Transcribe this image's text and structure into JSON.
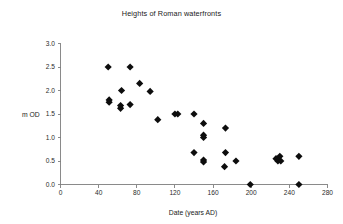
{
  "chart_data": {
    "type": "scatter",
    "title": "Heights of Roman waterfronts",
    "xlabel": "Date (years AD)",
    "ylabel": "m OD",
    "xlim": [
      0,
      280
    ],
    "ylim": [
      0,
      3.0
    ],
    "xticks": [
      0,
      40,
      80,
      120,
      160,
      200,
      240,
      280
    ],
    "xtick_labels": [
      "0",
      "40",
      "80",
      "120",
      "160",
      "200",
      "240",
      "280"
    ],
    "yticks": [
      0.0,
      0.5,
      1.0,
      1.5,
      2.0,
      2.5,
      3.0
    ],
    "ytick_labels": [
      "0.0",
      "0.5",
      "1.0",
      "1.5",
      "2.0",
      "2.5",
      "3.0"
    ],
    "grid": false,
    "legend": false,
    "marker": "diamond",
    "marker_color": "#0d0d0d",
    "points": [
      {
        "x": 50,
        "y": 2.5
      },
      {
        "x": 73,
        "y": 2.5
      },
      {
        "x": 83,
        "y": 2.15
      },
      {
        "x": 64,
        "y": 2.0
      },
      {
        "x": 94,
        "y": 1.98
      },
      {
        "x": 51,
        "y": 1.8
      },
      {
        "x": 51,
        "y": 1.75
      },
      {
        "x": 73,
        "y": 1.7
      },
      {
        "x": 63,
        "y": 1.68
      },
      {
        "x": 63,
        "y": 1.62
      },
      {
        "x": 120,
        "y": 1.5
      },
      {
        "x": 123,
        "y": 1.5
      },
      {
        "x": 140,
        "y": 1.5
      },
      {
        "x": 102,
        "y": 1.38
      },
      {
        "x": 150,
        "y": 1.3
      },
      {
        "x": 173,
        "y": 1.2
      },
      {
        "x": 150,
        "y": 1.05
      },
      {
        "x": 150,
        "y": 1.0
      },
      {
        "x": 140,
        "y": 0.68
      },
      {
        "x": 173,
        "y": 0.68
      },
      {
        "x": 230,
        "y": 0.6
      },
      {
        "x": 250,
        "y": 0.6
      },
      {
        "x": 150,
        "y": 0.52
      },
      {
        "x": 150,
        "y": 0.48
      },
      {
        "x": 184,
        "y": 0.5
      },
      {
        "x": 226,
        "y": 0.55
      },
      {
        "x": 228,
        "y": 0.5
      },
      {
        "x": 231,
        "y": 0.5
      },
      {
        "x": 172,
        "y": 0.38
      },
      {
        "x": 199,
        "y": 0.0
      },
      {
        "x": 250,
        "y": 0.0
      }
    ]
  }
}
